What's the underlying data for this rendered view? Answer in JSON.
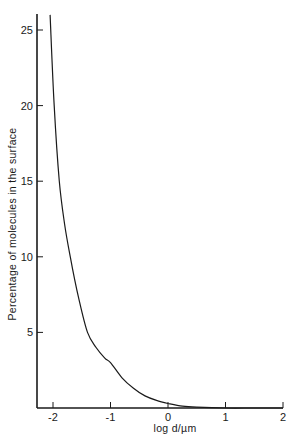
{
  "chart_data": {
    "type": "line",
    "title": "",
    "xlabel": "log d/µm",
    "ylabel": "Percentage of molecules in the surface",
    "xlim": [
      -2.3,
      2
    ],
    "ylim": [
      0,
      26
    ],
    "x_ticks": [
      -2,
      -1,
      0,
      1,
      2
    ],
    "x_tick_labels": [
      "-2",
      "-1",
      "0",
      "1",
      "2"
    ],
    "y_ticks": [
      5,
      10,
      15,
      20,
      25
    ],
    "y_tick_labels": [
      "5",
      "10",
      "15",
      "20",
      "25"
    ],
    "grid": false,
    "legend": null,
    "series": [
      {
        "name": "Percentage of molecules in the surface",
        "x": [
          -2.05,
          -1.98,
          -1.89,
          -1.8,
          -1.7,
          -1.55,
          -1.4,
          -1.25,
          -1.1,
          -1.0,
          -0.8,
          -0.6,
          -0.4,
          -0.2,
          0.0,
          0.25,
          0.5,
          1.0,
          1.5,
          2.0
        ],
        "y": [
          26.0,
          20.0,
          15.0,
          12.2,
          10.0,
          7.2,
          5.0,
          4.0,
          3.3,
          3.0,
          2.0,
          1.3,
          0.8,
          0.5,
          0.3,
          0.12,
          0.05,
          0.0,
          0.0,
          0.0
        ]
      }
    ],
    "axes": {
      "x_origin_px": 168,
      "x_unit_px": 57.5,
      "y_origin_px": 408,
      "y_unit_px": 15.12,
      "left_px": 37,
      "top_px": 14,
      "right_px": 283
    }
  },
  "figure": {
    "xlabel": "log d/µm",
    "ylabel": "Percentage of molecules in the surface"
  }
}
